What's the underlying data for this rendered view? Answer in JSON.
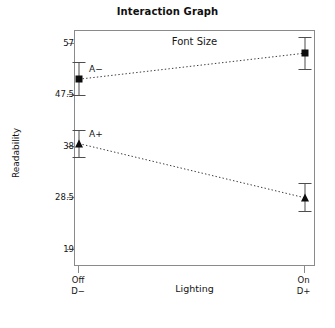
{
  "chart_data": {
    "type": "line",
    "title": "Interaction Graph",
    "xlabel": "Lighting",
    "ylabel": "Readability",
    "legend_title": "Font Size",
    "legend_position": "top-center-inside",
    "grid": false,
    "categories": [
      "Off\nD−",
      "On\nD+"
    ],
    "x_tick_labels": [
      {
        "line1": "Off",
        "line2": "D−"
      },
      {
        "line1": "On",
        "line2": "D+"
      }
    ],
    "y_tick_labels": [
      "57",
      "47.5",
      "38",
      "28.5",
      "19"
    ],
    "y_tick_values": [
      57,
      47.5,
      38,
      28.5,
      19
    ],
    "ylim": [
      15.8,
      59.4
    ],
    "xlim": [
      0,
      1
    ],
    "series": [
      {
        "name": "A−",
        "marker": "square",
        "label_x_offset": 10,
        "values": [
          50.5,
          55.3
        ],
        "error_low": [
          47.5,
          52.3
        ],
        "error_high": [
          53.6,
          58.2
        ]
      },
      {
        "name": "A+",
        "marker": "triangle",
        "label_x_offset": 10,
        "values": [
          38.6,
          28.6
        ],
        "error_low": [
          36.2,
          26.1
        ],
        "error_high": [
          41.1,
          31.3
        ]
      }
    ],
    "colors": {
      "marker": "#0d0d0d",
      "errorbar": "#4d4d4d",
      "frame": "#8a8a8a",
      "connector": "#3a3a3a",
      "text": "#141414"
    }
  }
}
